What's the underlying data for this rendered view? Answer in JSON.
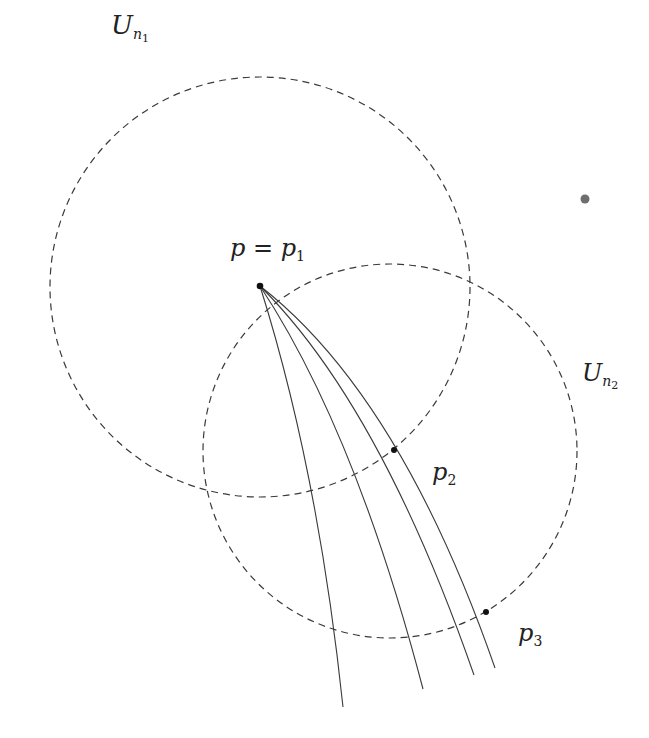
{
  "diagram": {
    "colors": {
      "stroke": "#3a3a3a",
      "dashed": "#3a3a3a",
      "point": "#111111",
      "stray_dot": "#555555",
      "background": "#ffffff"
    },
    "neighborhoods": [
      {
        "id": "U_n1",
        "label_base": "U",
        "label_sub": "n",
        "label_subsub": "1",
        "cx": 260,
        "cy": 287,
        "r": 210
      },
      {
        "id": "U_n2",
        "label_base": "U",
        "label_sub": "n",
        "label_subsub": "2",
        "cx": 390,
        "cy": 451,
        "r": 187
      }
    ],
    "points": [
      {
        "id": "p1",
        "label": "p = p",
        "label_sub": "1",
        "x": 260,
        "y": 286
      },
      {
        "id": "p2",
        "label": "p",
        "label_sub": "2",
        "x": 394,
        "y": 450
      },
      {
        "id": "p3",
        "label": "p",
        "label_sub": "3",
        "x": 486,
        "y": 612
      }
    ],
    "curves": [
      {
        "id": "curve-1",
        "start": [
          260,
          286
        ],
        "end": [
          343,
          707
        ],
        "ctrl": [
          320,
          420
        ]
      },
      {
        "id": "curve-2",
        "start": [
          260,
          286
        ],
        "end": [
          423,
          689
        ],
        "ctrl": [
          350,
          400
        ]
      },
      {
        "id": "curve-3",
        "start": [
          260,
          286
        ],
        "end": [
          474,
          675
        ],
        "ctrl": [
          380,
          390
        ]
      },
      {
        "id": "curve-4",
        "start": [
          260,
          286
        ],
        "end": [
          495,
          668
        ],
        "ctrl": [
          400,
          385
        ]
      }
    ],
    "stray_dot": {
      "x": 585,
      "y": 199
    },
    "labels": {
      "u_n1": {
        "base": "U",
        "sub": "n",
        "subsub": "1"
      },
      "u_n2": {
        "base": "U",
        "sub": "n",
        "subsub": "2"
      },
      "p1": {
        "text": "p = p",
        "sub": "1"
      },
      "p2": {
        "text": "p",
        "sub": "2"
      },
      "p3": {
        "text": "p",
        "sub": "3"
      }
    }
  }
}
